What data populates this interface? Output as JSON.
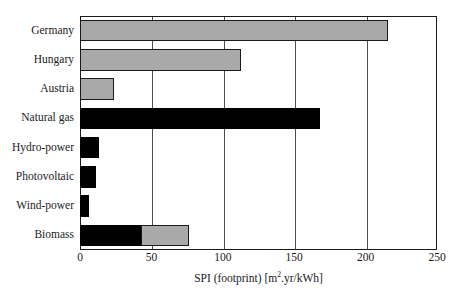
{
  "chart_data": {
    "type": "bar",
    "orientation": "horizontal",
    "title": "",
    "xlabel": "SPI (footprint) [m².yr/kWh]",
    "xlabel_parts": {
      "main": "SPI (footprint) [m",
      "sup": "2",
      "tail": ".yr/kWh]"
    },
    "ylabel": "",
    "xlim": [
      0,
      250
    ],
    "xticks": [
      0,
      50,
      100,
      150,
      200,
      250
    ],
    "xtick_labels": [
      "0",
      "50",
      "100",
      "150",
      "200",
      "250"
    ],
    "grid": true,
    "grid_axis": "x",
    "categories": [
      "Germany",
      "Hungary",
      "Austria",
      "Natural gas",
      "Hydro-power",
      "Photovoltaic",
      "Wind-power",
      "Biomass"
    ],
    "values": [
      216,
      113,
      24,
      168,
      13,
      11,
      6,
      76
    ],
    "series": [
      {
        "name": "black segment",
        "color": "#000000",
        "values": [
          0,
          0,
          0,
          168,
          13,
          11,
          6,
          43
        ]
      },
      {
        "name": "grey segment",
        "color": "#a9a9a9",
        "values": [
          216,
          113,
          24,
          0,
          0,
          0,
          0,
          33
        ]
      }
    ],
    "bar_colors": [
      "#a9a9a9",
      "#a9a9a9",
      "#a9a9a9",
      "#000000",
      "#000000",
      "#000000",
      "#000000",
      "#000000"
    ],
    "stacked_note": "Biomass is split: black 0-43, grey 43-76",
    "colors": {
      "grey": "#a9a9a9",
      "black": "#000000",
      "frame": "#1a1a1a",
      "grid": "#4d4d4d"
    }
  }
}
